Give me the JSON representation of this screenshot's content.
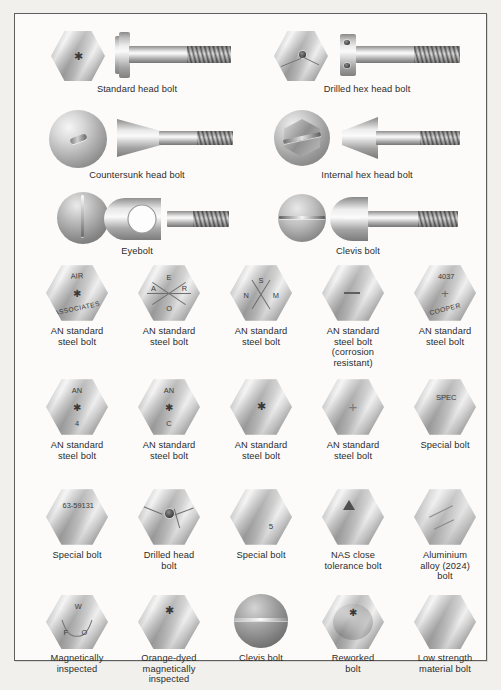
{
  "figure": {
    "kind": "bolt-identification-chart",
    "frame_border_color": "#5e5e5e",
    "background_color": "#f1f0ec",
    "panel_color": "#fcfbf9",
    "text_color": "#2c2c2c"
  },
  "rows": [
    {
      "row_id": "row-1",
      "items": [
        {
          "id": "standard-head-bolt",
          "caption": "Standard head bolt",
          "head_marking": "asterisk",
          "view": "head-and-side"
        },
        {
          "id": "drilled-hex-head-bolt",
          "caption": "Drilled hex head bolt",
          "head_marking": "drilled-hole",
          "view": "head-and-side"
        }
      ]
    },
    {
      "row_id": "row-2",
      "items": [
        {
          "id": "countersunk-head-bolt",
          "caption": "Countersunk head bolt",
          "head_marking": "slot",
          "view": "head-and-side"
        },
        {
          "id": "internal-hex-head-bolt",
          "caption": "Internal hex head bolt",
          "head_marking": "internal-hex",
          "view": "head-and-side"
        }
      ]
    },
    {
      "row_id": "row-3",
      "items": [
        {
          "id": "eyebolt",
          "caption": "Eyebolt",
          "head_marking": "slot",
          "view": "head-and-side"
        },
        {
          "id": "clevis-bolt",
          "caption": "Clevis bolt",
          "head_marking": "slot",
          "view": "head-and-side"
        }
      ]
    },
    {
      "row_id": "row-4",
      "items": [
        {
          "id": "an-standard-steel-bolt-air-associates",
          "caption": "AN standard\nsteel bolt",
          "marks": [
            "AIR",
            "ASSOCIATES"
          ],
          "symbol": "asterisk"
        },
        {
          "id": "an-standard-steel-bolt-aero",
          "caption": "AN standard\nsteel bolt",
          "marks": [
            "A",
            "E",
            "R",
            "O"
          ],
          "symbol": "x-cross"
        },
        {
          "id": "an-standard-steel-bolt-snm",
          "caption": "AN standard\nsteel bolt",
          "marks": [
            "S",
            "N",
            "M"
          ],
          "symbol": "x-cross"
        },
        {
          "id": "an-standard-steel-bolt-corrosion",
          "caption": "AN standard\nsteel bolt\n(corrosion\nresistant)",
          "marks": [],
          "symbol": "dash"
        },
        {
          "id": "an-standard-steel-bolt-4037-cooper",
          "caption": "AN standard\nsteel bolt",
          "marks": [
            "4037",
            "COOPER"
          ],
          "symbol": "plus"
        }
      ]
    },
    {
      "row_id": "row-5",
      "items": [
        {
          "id": "an-standard-steel-bolt-an-4",
          "caption": "AN standard\nsteel bolt",
          "marks": [
            "AN",
            "4"
          ],
          "symbol": "asterisk"
        },
        {
          "id": "an-standard-steel-bolt-an-c",
          "caption": "AN standard\nsteel bolt",
          "marks": [
            "AN",
            "C"
          ],
          "symbol": "asterisk"
        },
        {
          "id": "an-standard-steel-bolt-plain-asterisk",
          "caption": "AN standard\nsteel bolt",
          "marks": [],
          "symbol": "asterisk"
        },
        {
          "id": "an-standard-steel-bolt-plus",
          "caption": "AN standard\nsteel bolt",
          "marks": [],
          "symbol": "plus"
        },
        {
          "id": "special-bolt-spec",
          "caption": "Special bolt",
          "marks": [
            "SPEC"
          ],
          "symbol": "none"
        }
      ]
    },
    {
      "row_id": "row-6",
      "items": [
        {
          "id": "special-bolt-63-59131",
          "caption": "Special bolt",
          "marks": [
            "63-59131"
          ],
          "symbol": "none"
        },
        {
          "id": "drilled-head-bolt",
          "caption": "Drilled head\nbolt",
          "marks": [],
          "symbol": "drilled-hole"
        },
        {
          "id": "special-bolt-5",
          "caption": "Special bolt",
          "marks": [
            "5"
          ],
          "symbol": "none"
        },
        {
          "id": "nas-close-tolerance-bolt",
          "caption": "NAS close\ntolerance bolt",
          "marks": [],
          "symbol": "triangle"
        },
        {
          "id": "aluminium-alloy-2024-bolt",
          "caption": "Aluminium\nalloy (2024)\nbolt",
          "marks": [],
          "symbol": "double-dash"
        }
      ]
    },
    {
      "row_id": "row-7",
      "items": [
        {
          "id": "magnetically-inspected-bolt",
          "caption": "Magnetically\ninspected",
          "marks": [
            "W",
            "F",
            "O"
          ],
          "symbol": "vee"
        },
        {
          "id": "orange-dyed-magnetically-inspected-bolt",
          "caption": "Orange-dyed\nmagnetically\ninspected",
          "marks": [],
          "symbol": "asterisk"
        },
        {
          "id": "clevis-bolt-round",
          "caption": "Clevis bolt",
          "marks": [],
          "symbol": "slot"
        },
        {
          "id": "reworked-bolt",
          "caption": "Reworked\nbolt",
          "marks": [],
          "symbol": "asterisk-recessed"
        },
        {
          "id": "low-strength-material-bolt",
          "caption": "Low strength\nmaterial bolt",
          "marks": [],
          "symbol": "none"
        }
      ]
    }
  ]
}
